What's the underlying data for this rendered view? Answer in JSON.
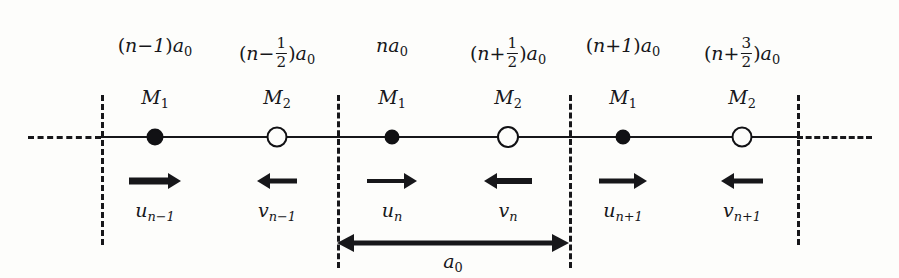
{
  "figure": {
    "background_color": "#fdfdfb",
    "ink_color": "#17171a",
    "lattice_constant_label": "a",
    "lattice_constant_sub": "0"
  },
  "positions": [
    {
      "id": "pos-n-minus-1",
      "open": "(",
      "body": "n−1",
      "close": ")",
      "unit": "a",
      "unit_sub": "0",
      "x": 155
    },
    {
      "id": "pos-n-minus-half",
      "open": "(",
      "body": "n−",
      "frac_num": "1",
      "frac_den": "2",
      "close": ")",
      "unit": "a",
      "unit_sub": "0",
      "x": 277
    },
    {
      "id": "pos-n",
      "open": "",
      "body": "n",
      "close": "",
      "unit": "a",
      "unit_sub": "0",
      "x": 392
    },
    {
      "id": "pos-n-plus-half",
      "open": "(",
      "body": "n+",
      "frac_num": "1",
      "frac_den": "2",
      "close": ")",
      "unit": "a",
      "unit_sub": "0",
      "x": 508
    },
    {
      "id": "pos-n-plus-1",
      "open": "(",
      "body": "n+1",
      "close": ")",
      "unit": "a",
      "unit_sub": "0",
      "x": 623
    },
    {
      "id": "pos-n-plus-3-halves",
      "open": "(",
      "body": "n+",
      "frac_num": "3",
      "frac_den": "2",
      "close": ")",
      "unit": "a",
      "unit_sub": "0",
      "x": 742
    }
  ],
  "atoms": [
    {
      "id": "atom-m1-cell1",
      "mass_label": "M",
      "mass_sub": "1",
      "type": "filled",
      "x": 155,
      "size": 17
    },
    {
      "id": "atom-m2-cell1",
      "mass_label": "M",
      "mass_sub": "2",
      "type": "open",
      "x": 277,
      "size": 21
    },
    {
      "id": "atom-m1-cell2",
      "mass_label": "M",
      "mass_sub": "1",
      "type": "filled",
      "x": 392,
      "size": 15
    },
    {
      "id": "atom-m2-cell2",
      "mass_label": "M",
      "mass_sub": "2",
      "type": "open",
      "x": 508,
      "size": 22
    },
    {
      "id": "atom-m1-cell3",
      "mass_label": "M",
      "mass_sub": "1",
      "type": "filled",
      "x": 623,
      "size": 15
    },
    {
      "id": "atom-m2-cell3",
      "mass_label": "M",
      "mass_sub": "2",
      "type": "open",
      "x": 742,
      "size": 21
    }
  ],
  "displacements": [
    {
      "id": "disp-u-n-minus-1",
      "symbol": "u",
      "sub": "n−1",
      "x": 155,
      "direction": "right",
      "length": 52,
      "thickness": 7
    },
    {
      "id": "disp-v-n-minus-1",
      "symbol": "v",
      "sub": "n−1",
      "x": 277,
      "direction": "left",
      "length": 40,
      "thickness": 5
    },
    {
      "id": "disp-u-n",
      "symbol": "u",
      "sub": "n",
      "x": 392,
      "direction": "right",
      "length": 50,
      "thickness": 4
    },
    {
      "id": "disp-v-n",
      "symbol": "v",
      "sub": "n",
      "x": 508,
      "direction": "left",
      "length": 48,
      "thickness": 6
    },
    {
      "id": "disp-u-n-plus-1",
      "symbol": "u",
      "sub": "n+1",
      "x": 623,
      "direction": "right",
      "length": 48,
      "thickness": 5
    },
    {
      "id": "disp-v-n-plus-1",
      "symbol": "v",
      "sub": "n+1",
      "x": 742,
      "direction": "left",
      "length": 42,
      "thickness": 5
    }
  ],
  "cell_dividers": [
    {
      "id": "divider-left",
      "x": 101,
      "top": 95,
      "bottom": 245
    },
    {
      "id": "divider-cell2-start",
      "x": 337,
      "top": 95,
      "bottom": 268
    },
    {
      "id": "divider-cell2-end",
      "x": 569,
      "top": 95,
      "bottom": 268
    },
    {
      "id": "divider-right",
      "x": 797,
      "top": 95,
      "bottom": 245
    }
  ],
  "chain": {
    "solid_start": 101,
    "solid_end": 797,
    "y": 137,
    "left_dash_start": 28,
    "left_dash_end": 101,
    "right_dash_start": 797,
    "right_dash_end": 872
  },
  "dimension": {
    "id": "lattice-constant-dimension",
    "label": "a",
    "label_sub": "0",
    "x_start": 337,
    "x_end": 569,
    "y": 243,
    "label_x": 453,
    "label_y": 252
  }
}
